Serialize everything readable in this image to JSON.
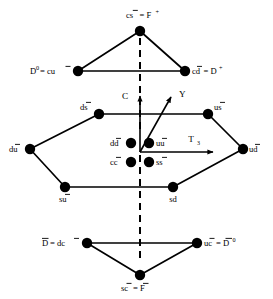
{
  "figure": {
    "background_color": "#ffffff",
    "line_color": "#000000",
    "node_color": "#000000"
  },
  "axes": {
    "vertical": {
      "label": "C",
      "name": "charm-axis",
      "direction": "up"
    },
    "diagonal": {
      "label": "Y",
      "name": "hypercharge-axis",
      "direction": "up-right"
    },
    "horizontal": {
      "label": "T",
      "subscript": "3",
      "name": "isospin-axis",
      "direction": "right"
    }
  },
  "symmetry_axis": {
    "name": "dashed-vertical-symmetry-axis",
    "style": "dashed"
  },
  "nodes": [
    {
      "id": "cs-bar",
      "label_plain": "cs = F+",
      "quark": "cs",
      "quark_bar": "s",
      "equals": "F",
      "super": "+",
      "x": 140,
      "y": 31,
      "lx": 140,
      "ly": 18,
      "anchor": "middle"
    },
    {
      "id": "cu-bar",
      "label_plain": "D0 = cu",
      "pre": "D",
      "pre_super": "0",
      "quark": "cu",
      "quark_bar": "u",
      "x": 78,
      "y": 71,
      "lx": 72,
      "ly": 74,
      "anchor": "end"
    },
    {
      "id": "cd-bar",
      "label_plain": "cd = D+",
      "quark": "cd",
      "quark_bar": "d",
      "equals": "D",
      "super": "+",
      "x": 185,
      "y": 71,
      "lx": 192,
      "ly": 74,
      "anchor": "start"
    },
    {
      "id": "ds-bar",
      "label_plain": "ds",
      "quark": "ds",
      "quark_bar": "s",
      "x": 99,
      "y": 114,
      "lx": 93,
      "ly": 110,
      "anchor": "end"
    },
    {
      "id": "us-bar",
      "label_plain": "us",
      "quark": "us",
      "quark_bar": "s",
      "x": 208,
      "y": 114,
      "lx": 214,
      "ly": 110,
      "anchor": "start"
    },
    {
      "id": "du-bar",
      "label_plain": "du",
      "quark": "du",
      "quark_bar": "u",
      "x": 30,
      "y": 149,
      "lx": 24,
      "ly": 152,
      "anchor": "end"
    },
    {
      "id": "ud-bar",
      "label_plain": "ud",
      "quark": "ud",
      "quark_bar": "d",
      "x": 243,
      "y": 149,
      "lx": 249,
      "ly": 152,
      "anchor": "start"
    },
    {
      "id": "su-bar",
      "label_plain": "su",
      "quark": "su",
      "quark_bar": "u",
      "x": 65,
      "y": 187,
      "lx": 65,
      "ly": 200,
      "anchor": "middle"
    },
    {
      "id": "sd",
      "label_plain": "sd",
      "quark": "sd",
      "quark_bar": "",
      "x": 173,
      "y": 187,
      "lx": 173,
      "ly": 200,
      "anchor": "middle"
    },
    {
      "id": "dc-bar",
      "label_plain": "D = dc",
      "pre": "D",
      "pre_bar": true,
      "quark": "dc",
      "quark_bar": "c",
      "x": 87,
      "y": 243,
      "lx": 81,
      "ly": 246,
      "anchor": "end"
    },
    {
      "id": "uc-bar",
      "label_plain": "uc = D0",
      "quark": "uc",
      "quark_bar": "c",
      "equals": "D",
      "equals_bar": true,
      "super": "0",
      "x": 197,
      "y": 243,
      "lx": 203,
      "ly": 246,
      "anchor": "start"
    },
    {
      "id": "sc-bar",
      "label_plain": "sc = F",
      "quark": "sc",
      "quark_bar": "c",
      "equals": "F",
      "equals_bar": true,
      "x": 140,
      "y": 275,
      "lx": 140,
      "ly": 290,
      "anchor": "middle"
    }
  ],
  "center_nodes": [
    {
      "id": "dd-bar",
      "label_plain": "dd",
      "quark": "dd",
      "quark_bar": "d",
      "x": 130,
      "y": 144,
      "lx": 124,
      "ly": 147,
      "anchor": "end"
    },
    {
      "id": "uu-bar",
      "label_plain": "uu",
      "quark": "uu",
      "quark_bar": "u",
      "x": 150,
      "y": 144,
      "lx": 157,
      "ly": 147,
      "anchor": "start"
    },
    {
      "id": "cc-bar",
      "label_plain": "cc",
      "quark": "cc",
      "quark_bar": "c",
      "x": 130,
      "y": 163,
      "lx": 124,
      "ly": 166,
      "anchor": "end"
    },
    {
      "id": "ss-bar",
      "label_plain": "ss",
      "quark": "ss",
      "quark_bar": "s",
      "x": 150,
      "y": 163,
      "lx": 157,
      "ly": 166,
      "anchor": "start"
    }
  ],
  "labels": {
    "cs_bar": {
      "base": "cs",
      "bar_over": "s",
      "rhs": "= F",
      "sup": "+"
    },
    "cu_bar": {
      "lhs": "D",
      "lhs_sup": "0",
      "rhs": "= cu",
      "bar_over": "u"
    },
    "cd_bar": {
      "base": "cd",
      "bar_over": "d",
      "rhs": "= D",
      "sup": "+"
    },
    "ds_bar": {
      "base": "ds",
      "bar_over": "s"
    },
    "us_bar": {
      "base": "us",
      "bar_over": "s"
    },
    "du_bar": {
      "base": "du",
      "bar_over": "u"
    },
    "ud_bar": {
      "base": "ud",
      "bar_over": "d"
    },
    "su_bar": {
      "base": "su",
      "bar_over": "u"
    },
    "sd": {
      "base": "sd"
    },
    "dc_bar": {
      "lhs": "D",
      "lhs_bar": true,
      "rhs": "= dc",
      "bar_over": "c"
    },
    "uc_bar": {
      "base": "uc",
      "bar_over": "c",
      "rhs": "= D",
      "rhs_bar": true,
      "sup": "0"
    },
    "sc_bar": {
      "base": "sc",
      "bar_over": "c",
      "rhs": "= F",
      "rhs_bar": true
    },
    "dd_bar": {
      "base": "dd",
      "bar_over": "d"
    },
    "uu_bar": {
      "base": "uu",
      "bar_over": "u"
    },
    "cc_bar": {
      "base": "cc",
      "bar_over": "c"
    },
    "ss_bar": {
      "base": "ss",
      "bar_over": "s"
    }
  },
  "edges": [
    {
      "name": "edge-cs-to-cu",
      "from": "cs-bar",
      "to": "cu-bar"
    },
    {
      "name": "edge-cs-to-cd",
      "from": "cs-bar",
      "to": "cd-bar"
    },
    {
      "name": "edge-cu-to-cd",
      "from": "cu-bar",
      "to": "cd-bar"
    },
    {
      "name": "edge-ds-to-us",
      "from": "ds-bar",
      "to": "us-bar"
    },
    {
      "name": "edge-ds-to-du",
      "from": "ds-bar",
      "to": "du-bar"
    },
    {
      "name": "edge-us-to-ud",
      "from": "us-bar",
      "to": "ud-bar"
    },
    {
      "name": "edge-du-to-su",
      "from": "du-bar",
      "to": "su-bar"
    },
    {
      "name": "edge-ud-to-sd",
      "from": "ud-bar",
      "to": "sd"
    },
    {
      "name": "edge-su-to-sd",
      "from": "su-bar",
      "to": "sd"
    },
    {
      "name": "edge-dc-to-uc",
      "from": "dc-bar",
      "to": "uc-bar"
    },
    {
      "name": "edge-dc-to-sc",
      "from": "dc-bar",
      "to": "sc-bar"
    },
    {
      "name": "edge-uc-to-sc",
      "from": "uc-bar",
      "to": "sc-bar"
    }
  ]
}
